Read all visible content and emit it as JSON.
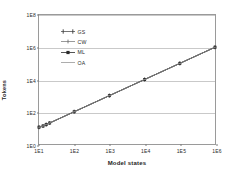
{
  "chart_data": {
    "type": "line",
    "title": "",
    "xlabel": "Model states",
    "ylabel": "Tokens",
    "xscale": "log",
    "yscale": "log",
    "xlim": [
      10,
      1000000
    ],
    "ylim": [
      1,
      100000000
    ],
    "grid": true,
    "legend_position": "upper-left-inside",
    "x_tick_labels": [
      "1E1",
      "1E2",
      "1E3",
      "1E4",
      "1E5",
      "1E6"
    ],
    "x_ticks": [
      10,
      100,
      1000,
      10000,
      100000,
      1000000
    ],
    "y_tick_labels": [
      "1E0",
      "1E2",
      "1E4",
      "1E6",
      "1E8"
    ],
    "y_ticks": [
      1,
      100,
      10000,
      1000000,
      100000000
    ],
    "x": [
      10,
      13,
      16,
      20,
      100,
      1000,
      10000,
      100000,
      1000000
    ],
    "series": [
      {
        "name": "GS",
        "marker": "plus",
        "color": "#3a3a3a",
        "values": [
          11,
          13,
          16,
          20,
          100,
          1000,
          10000,
          100000,
          1000000
        ]
      },
      {
        "name": "CW",
        "marker": "tick",
        "color": "#6e6e6e",
        "values": [
          11,
          13,
          16,
          20,
          100,
          1000,
          10000,
          100000,
          1000000
        ]
      },
      {
        "name": "ML",
        "marker": "square",
        "color": "#2a2a2a",
        "values": [
          11,
          13,
          16,
          20,
          100,
          1000,
          10000,
          100000,
          1000000
        ]
      },
      {
        "name": "OA",
        "marker": "dash",
        "color": "#8a8a8a",
        "values": [
          11,
          13,
          16,
          20,
          100,
          1000,
          10000,
          100000,
          1000000
        ]
      }
    ]
  },
  "axes": {
    "x_title": "Model states",
    "y_title": "Tokens",
    "x_labels": [
      "1E1",
      "1E2",
      "1E3",
      "1E4",
      "1E5",
      "1E6"
    ],
    "y_labels": [
      "1E8",
      "1E6",
      "1E4",
      "1E2",
      "1E0"
    ]
  },
  "legend": {
    "items": [
      {
        "label": "GS"
      },
      {
        "label": "CW"
      },
      {
        "label": "ML"
      },
      {
        "label": "OA"
      }
    ]
  },
  "colors": {
    "frame": "#9a9a9a",
    "grid": "#c9c9c9",
    "line": "#3a3a3a",
    "background": "#ffffff"
  }
}
